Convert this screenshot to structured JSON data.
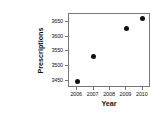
{
  "chart_data": {
    "type": "scatter",
    "title": "",
    "xlabel": "Year",
    "ylabel": "Prescriptions",
    "x": [
      2006,
      2007,
      2009,
      2010
    ],
    "values": [
      3447,
      3532,
      3627,
      3664
    ],
    "points": [
      {
        "x": 2006,
        "y": 3447
      },
      {
        "x": 2007,
        "y": 3532
      },
      {
        "x": 2009,
        "y": 3627
      },
      {
        "x": 2010,
        "y": 3664
      }
    ],
    "xticks": [
      2006,
      2007,
      2008,
      2009,
      2010
    ],
    "xtick_labels": [
      "2006",
      "2007",
      "2008",
      "2009",
      "2010"
    ],
    "yticks": [
      3450,
      3500,
      3550,
      3600,
      3650
    ],
    "ytick_labels": [
      "3450",
      "3500",
      "3550",
      "3600",
      "3650"
    ],
    "xlim": [
      2005.5,
      2010.5
    ],
    "ylim": [
      3425,
      3678
    ],
    "grid": false,
    "legend": false,
    "marker": "filled-circle",
    "marker_color": "#111111"
  },
  "axes": {
    "x_title": "Year",
    "y_title": "Prescriptions"
  }
}
